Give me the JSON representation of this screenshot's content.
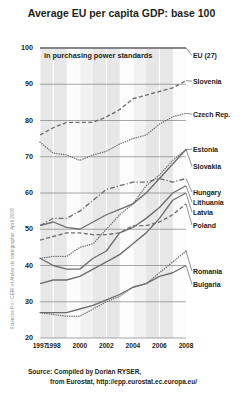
{
  "title": "Average EU per capita GDP: base 100",
  "note": "in purchasing power standards",
  "credit": "Sciences Po / CERI et Atelier de cartographie, April 2008",
  "source": {
    "line1": "Source: Compiled by Dorian RYSER,",
    "line2": "from Eurostat, http://epp.eurostat.ec.europa.eu/"
  },
  "colors": {
    "ink": "#231f20",
    "line": "#6d6e71",
    "band": "#d9d9d9",
    "plot_bg": "#f2f2f2",
    "grid": "#808285"
  },
  "chart_data": {
    "type": "line",
    "title": "Average EU per capita GDP: base 100",
    "subtitle": "in purchasing power standards",
    "xlabel": "",
    "ylabel": "",
    "xlim": [
      1997,
      2008
    ],
    "ylim": [
      20,
      100
    ],
    "yticks": [
      20,
      30,
      40,
      50,
      60,
      70,
      80,
      90,
      100
    ],
    "xticks": [
      1997,
      1998,
      2000,
      2002,
      2004,
      2006,
      2008
    ],
    "grid": true,
    "legend": "right-inline-labels",
    "x": [
      1997,
      1998,
      1999,
      2000,
      2001,
      2002,
      2003,
      2004,
      2005,
      2006,
      2007,
      2008
    ],
    "series": [
      {
        "name": "EU (27)",
        "style": "solid",
        "values": [
          100,
          100,
          100,
          100,
          100,
          100,
          100,
          100,
          100,
          100,
          100,
          100
        ]
      },
      {
        "name": "Slovenia",
        "style": "dashed",
        "values": [
          76,
          78,
          79.5,
          79.5,
          79.5,
          81,
          83,
          86,
          87,
          88,
          89,
          91
        ]
      },
      {
        "name": "Czech Rep.",
        "style": "dotted",
        "values": [
          74,
          71,
          70.5,
          69,
          70.5,
          71.5,
          73.5,
          75,
          76,
          79,
          81,
          82
        ]
      },
      {
        "name": "Estonia",
        "style": "dotted",
        "values": [
          42,
          42.5,
          42.5,
          45,
          46,
          50,
          54,
          57,
          62,
          65,
          69,
          72
        ]
      },
      {
        "name": "Slovakia",
        "style": "solid",
        "values": [
          51,
          52,
          50.5,
          50,
          52,
          54,
          55.5,
          57,
          60,
          64,
          68,
          72
        ]
      },
      {
        "name": "Hungary",
        "style": "dash-dot",
        "values": [
          51,
          53,
          53,
          55,
          58,
          61,
          62,
          63,
          63,
          64,
          63,
          64
        ]
      },
      {
        "name": "Lithuania",
        "style": "solid",
        "values": [
          42,
          40,
          39,
          39,
          42,
          44,
          49,
          50.5,
          53,
          56,
          60,
          62
        ]
      },
      {
        "name": "Latvia",
        "style": "solid",
        "values": [
          35,
          36,
          36,
          37,
          39,
          41,
          43,
          46,
          49,
          53,
          58,
          60
        ]
      },
      {
        "name": "Poland",
        "style": "dashed",
        "values": [
          47,
          48,
          49,
          49,
          48.5,
          48.5,
          49,
          51,
          51,
          52,
          54,
          57
        ]
      },
      {
        "name": "Romania",
        "style": "dotted",
        "values": [
          27,
          26.5,
          26,
          26,
          28,
          30,
          31.5,
          34,
          35,
          38,
          41,
          44
        ]
      },
      {
        "name": "Bulgaria",
        "style": "solid",
        "values": [
          27,
          27,
          27,
          28,
          29,
          30.5,
          32,
          34,
          35,
          37,
          38,
          40
        ]
      }
    ]
  },
  "ylabels": [
    "100",
    "90",
    "80",
    "70",
    "60",
    "50",
    "40",
    "30",
    "20"
  ],
  "xlabels": [
    "1997",
    "1998",
    "2000",
    "2002",
    "2004",
    "2006",
    "2008"
  ],
  "series_labels": [
    {
      "name": "EU (27)"
    },
    {
      "name": "Slovenia"
    },
    {
      "name": "Czech Rep."
    },
    {
      "name": "Estonia"
    },
    {
      "name": "Slovakia"
    },
    {
      "name": "Hungary"
    },
    {
      "name": "Lithuania"
    },
    {
      "name": "Latvia"
    },
    {
      "name": "Poland"
    },
    {
      "name": "Romania"
    },
    {
      "name": "Bulgaria"
    }
  ]
}
